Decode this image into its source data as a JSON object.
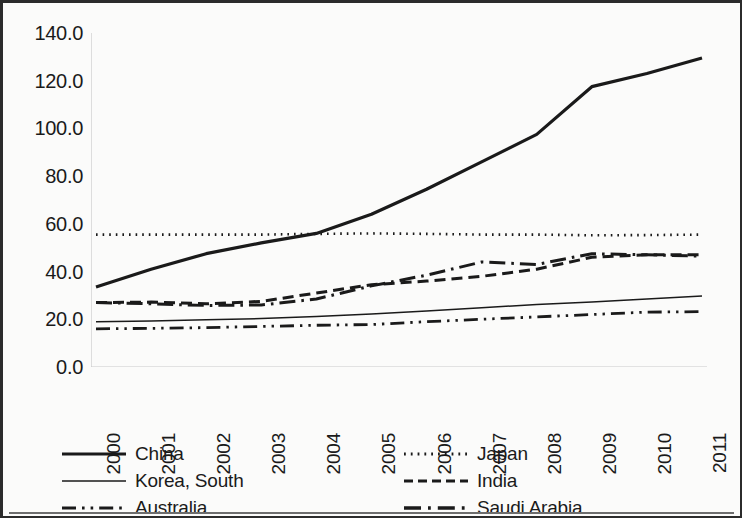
{
  "chart_data": {
    "type": "line",
    "title": "",
    "subtitle": "",
    "xlabel": "",
    "ylabel": "",
    "x": [
      "2000",
      "2001",
      "2002",
      "2003",
      "2004",
      "2005",
      "2006",
      "2007",
      "2008",
      "2009",
      "2010",
      "2011"
    ],
    "categories": [
      "2000",
      "2001",
      "2002",
      "2003",
      "2004",
      "2005",
      "2006",
      "2007",
      "2008",
      "2009",
      "2010",
      "2011"
    ],
    "xlim": [
      2000,
      2011
    ],
    "ylim": [
      0.0,
      140.0
    ],
    "y_ticks": [
      "0.0",
      "20.0",
      "40.0",
      "60.0",
      "80.0",
      "100.0",
      "120.0",
      "140.0"
    ],
    "y_tick_values": [
      0.0,
      20.0,
      40.0,
      60.0,
      80.0,
      100.0,
      120.0,
      140.0
    ],
    "y_tick_interval": 20.0,
    "grid": false,
    "legend_position": "bottom",
    "legend_columns": 2,
    "series": [
      {
        "name": "China",
        "style": "solid",
        "width": 3.2,
        "color": "#1a1a1a",
        "values": [
          33.5,
          41.0,
          47.5,
          52.0,
          56.0,
          64.0,
          74.5,
          86.0,
          97.5,
          117.5,
          123.0,
          129.5
        ]
      },
      {
        "name": "Japan",
        "style": "dotted",
        "width": 2.6,
        "color": "#1a1a1a",
        "values": [
          55.5,
          55.5,
          55.5,
          55.5,
          55.8,
          56.0,
          55.8,
          55.5,
          55.5,
          55.2,
          55.3,
          55.5
        ]
      },
      {
        "name": "Korea, South",
        "style": "solid",
        "width": 1.5,
        "color": "#1a1a1a",
        "values": [
          19.0,
          19.3,
          19.8,
          20.3,
          21.2,
          22.2,
          23.5,
          24.8,
          26.2,
          27.2,
          28.5,
          29.8
        ]
      },
      {
        "name": "India",
        "style": "dashed",
        "width": 3.0,
        "color": "#1a1a1a",
        "values": [
          27.0,
          27.2,
          26.5,
          27.5,
          31.0,
          34.5,
          36.0,
          38.0,
          41.0,
          46.0,
          47.0,
          47.0
        ]
      },
      {
        "name": "Australia",
        "style": "dashdotdot",
        "width": 2.8,
        "color": "#1a1a1a",
        "values": [
          16.0,
          16.2,
          16.5,
          17.0,
          17.5,
          17.8,
          19.0,
          20.0,
          21.0,
          22.0,
          23.0,
          23.2
        ]
      },
      {
        "name": "Saudi Arabia",
        "style": "dashdot",
        "width": 3.0,
        "color": "#1a1a1a",
        "values": [
          27.0,
          26.5,
          25.8,
          26.0,
          28.5,
          34.0,
          38.5,
          44.0,
          43.0,
          47.5,
          47.0,
          46.5
        ]
      }
    ]
  },
  "axes": {
    "y_labels": [
      "140.0",
      "120.0",
      "100.0",
      "80.0",
      "60.0",
      "40.0",
      "20.0",
      "0.0"
    ],
    "x_labels": [
      "2000",
      "2001",
      "2002",
      "2003",
      "2004",
      "2005",
      "2006",
      "2007",
      "2008",
      "2009",
      "2010",
      "2011"
    ]
  },
  "legend": {
    "items": [
      {
        "label": "China",
        "style": "solid-thick"
      },
      {
        "label": "Korea, South",
        "style": "solid-thin"
      },
      {
        "label": "Australia",
        "style": "dashdotdot"
      },
      {
        "label": "Japan",
        "style": "dotted"
      },
      {
        "label": "India",
        "style": "dashed"
      },
      {
        "label": "Saudi Arabia",
        "style": "dashdot"
      }
    ]
  }
}
